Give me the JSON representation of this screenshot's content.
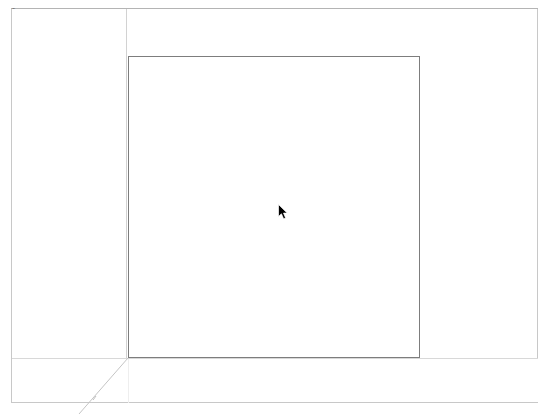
{
  "window": {
    "corner_label": "Top",
    "background_color": "#ffffff",
    "frame_border_color": "#c8c8c8",
    "titlebar_rule_color": "#b4b4b4"
  },
  "layout": {
    "side_panel": {
      "name": "left-panel",
      "content": ""
    },
    "main_area": {
      "name": "main-drawing-area",
      "content": ""
    },
    "content_rect": {
      "name": "content-rectangle",
      "border_color": "#7d7d7d",
      "content": ""
    },
    "footer": {
      "name": "footer-strip",
      "content": "",
      "rule_color": "#d8d8d8"
    },
    "divider": {
      "color": "#d2d2d2"
    }
  },
  "annotations": {
    "diagonal_guide": {
      "name": "diagonal-guide-line",
      "color": "#c0c0c0"
    }
  },
  "cursor": {
    "type": "arrow-pointer",
    "x": 280,
    "y": 209,
    "color": "#000000"
  }
}
